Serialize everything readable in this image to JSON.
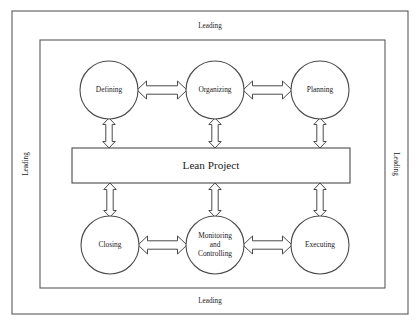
{
  "diagram": {
    "center": {
      "label": "Lean Project",
      "box": {
        "x": 72,
        "y": 148,
        "width": 278,
        "height": 35
      }
    },
    "edge_labels": {
      "top": "Leading",
      "bottom": "Leading",
      "left": "Leading",
      "right": "Leading"
    },
    "frames": [
      {
        "name": "outer-frame",
        "x": 12,
        "y": 11,
        "width": 396,
        "height": 303
      },
      {
        "name": "inner-frame",
        "x": 40,
        "y": 40,
        "width": 345,
        "height": 248
      }
    ],
    "nodes": [
      {
        "id": "defining",
        "label": "Defining",
        "cx": 109,
        "cy": 90,
        "r": 29,
        "lines": [
          "Defining"
        ]
      },
      {
        "id": "organizing",
        "label": "Organizing",
        "cx": 215,
        "cy": 90,
        "r": 29,
        "lines": [
          "Organizing"
        ]
      },
      {
        "id": "planning",
        "label": "Planning",
        "cx": 320,
        "cy": 90,
        "r": 29,
        "lines": [
          "Planning"
        ]
      },
      {
        "id": "closing",
        "label": "Closing",
        "cx": 110,
        "cy": 245,
        "r": 29,
        "lines": [
          "Closing"
        ]
      },
      {
        "id": "monitoring-and-controlling",
        "label": "Monitoring and Controlling",
        "cx": 215,
        "cy": 245,
        "r": 29,
        "lines": [
          "Monitoring",
          "and",
          "Controlling"
        ]
      },
      {
        "id": "executing",
        "label": "Executing",
        "cx": 320,
        "cy": 245,
        "r": 29,
        "lines": [
          "Executing"
        ]
      }
    ],
    "connectors": [
      {
        "name": "connector-defining-organizing",
        "from": "defining",
        "to": "organizing",
        "orientation": "horizontal",
        "double_headed": true
      },
      {
        "name": "connector-organizing-planning",
        "from": "organizing",
        "to": "planning",
        "orientation": "horizontal",
        "double_headed": true
      },
      {
        "name": "connector-closing-monitoring",
        "from": "closing",
        "to": "monitoring-and-controlling",
        "orientation": "horizontal",
        "double_headed": true
      },
      {
        "name": "connector-monitoring-executing",
        "from": "monitoring-and-controlling",
        "to": "executing",
        "orientation": "horizontal",
        "double_headed": true
      },
      {
        "name": "connector-defining-center",
        "from": "defining",
        "to": "center",
        "orientation": "vertical",
        "double_headed": true
      },
      {
        "name": "connector-organizing-center",
        "from": "organizing",
        "to": "center",
        "orientation": "vertical",
        "double_headed": true
      },
      {
        "name": "connector-planning-center",
        "from": "planning",
        "to": "center",
        "orientation": "vertical",
        "double_headed": true
      },
      {
        "name": "connector-center-closing",
        "from": "center",
        "to": "closing",
        "orientation": "vertical",
        "double_headed": true
      },
      {
        "name": "connector-center-monitoring",
        "from": "center",
        "to": "monitoring-and-controlling",
        "orientation": "vertical",
        "double_headed": true
      },
      {
        "name": "connector-center-executing",
        "from": "center",
        "to": "executing",
        "orientation": "vertical",
        "double_headed": true
      }
    ],
    "colors": {
      "background": "#ffffff",
      "stroke": "#4a4a4a",
      "frame_stroke": "#5a5a5a",
      "text": "#1a1a1a"
    }
  }
}
